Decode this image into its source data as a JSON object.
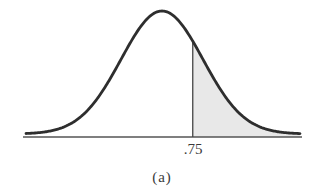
{
  "figure": {
    "caption": "(a)"
  },
  "chart_data": {
    "type": "area",
    "title": "",
    "distribution": "normal",
    "mean": 0,
    "sd": 1,
    "xlabel": "",
    "ylabel": "",
    "tick_labels": [
      ".75"
    ],
    "shaded_region": {
      "from": 0.75,
      "to": "infinity",
      "side": "right"
    },
    "cutoff": 0.75,
    "caption": "(a)",
    "grid": false,
    "legend": null
  },
  "labels": {
    "cutoff_tick": ".75"
  },
  "style": {
    "curve_color": "#2e2e2e",
    "shade_color": "#e8e8e8",
    "axis_color": "#555555",
    "cutoff_line_color": "#444444"
  }
}
